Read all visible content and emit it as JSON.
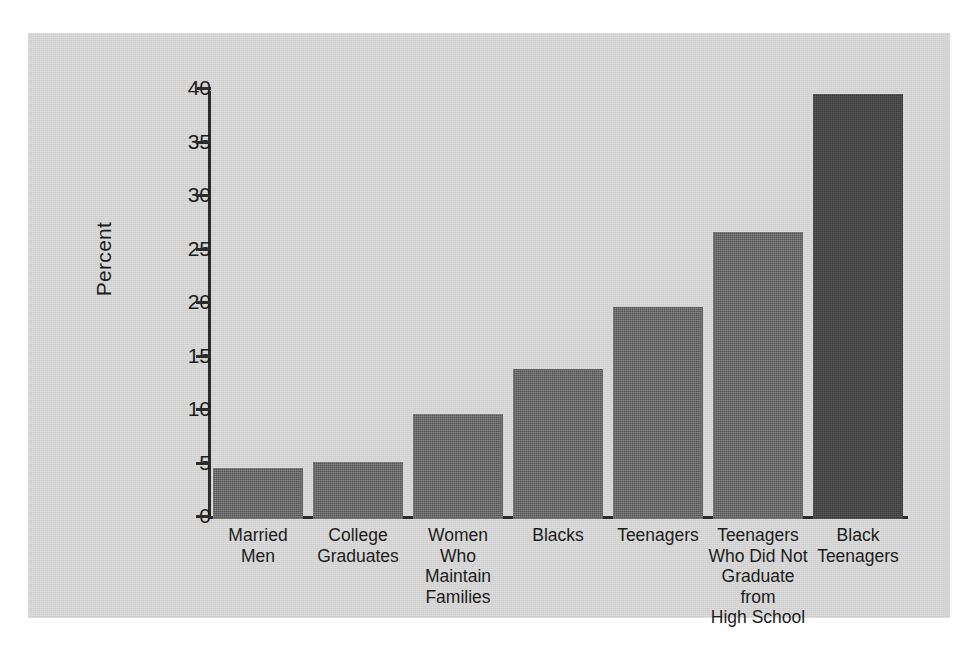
{
  "chart_data": {
    "type": "bar",
    "title": "",
    "xlabel": "",
    "ylabel": "Percent",
    "ylim": [
      0,
      40
    ],
    "yticks": [
      0,
      5,
      10,
      15,
      20,
      25,
      30,
      35,
      40
    ],
    "ytick_labels": [
      "0",
      "5",
      "10",
      "15",
      "20",
      "25",
      "30",
      "35",
      "40"
    ],
    "grid": false,
    "legend": false,
    "categories": [
      "Married\nMen",
      "College\nGraduates",
      "Women Who\nMaintain\nFamilies",
      "Blacks",
      "Teenagers",
      "Teenagers\nWho Did Not\nGraduate from\nHigh School",
      "Black\nTeenagers"
    ],
    "values": [
      4.8,
      5.3,
      9.8,
      14.0,
      19.8,
      26.8,
      39.7
    ],
    "bar_colors": [
      "#555555",
      "#555555",
      "#555555",
      "#555555",
      "#555555",
      "#555555",
      "#383838"
    ]
  },
  "style": {
    "page_background": "#ffffff",
    "panel_background": "#d2d2d2",
    "axis_color": "#2b2b2b",
    "text_color": "#1c1c1c",
    "bar_color": "#555555",
    "bar_color_highlight": "#383838"
  }
}
